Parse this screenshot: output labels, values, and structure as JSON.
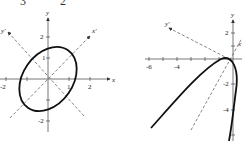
{
  "top_fragment": {
    "left": "3",
    "right": "2"
  },
  "figures": [
    {
      "name": "ellipse",
      "axes": {
        "x_label": "x",
        "y_label": "y",
        "x_prime_label": "x'",
        "y_prime_label": "y'"
      },
      "x_ticks": [
        "-2",
        "1",
        "2"
      ],
      "y_ticks": [
        "2",
        "1",
        "-2"
      ]
    },
    {
      "name": "parabola",
      "axes": {
        "x_label": "x",
        "y_label": "y",
        "x_prime_label": "x'",
        "y_prime_label": "y'"
      },
      "x_ticks": [
        "-6",
        "-4"
      ],
      "y_ticks": [
        "2",
        "-2",
        "-4"
      ]
    }
  ]
}
